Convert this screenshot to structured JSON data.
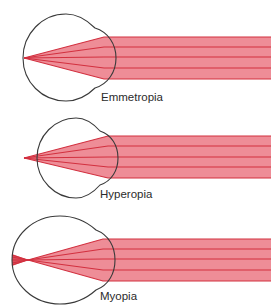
{
  "colors": {
    "beam_fill": "#ee8d97",
    "ray_line": "#d2303f",
    "eye_outline": "#3a3a3a",
    "label_text": "#2b2b2b",
    "background": "#ffffff"
  },
  "panels": [
    {
      "id": "emmetropia",
      "label": "Emmetropia",
      "description": "Parallel rays focus exactly on the retina",
      "focal_point": "on-retina"
    },
    {
      "id": "hyperopia",
      "label": "Hyperopia",
      "description": "Parallel rays focus behind the retina",
      "focal_point": "behind-retina"
    },
    {
      "id": "myopia",
      "label": "Myopia",
      "description": "Parallel rays focus in front of the retina",
      "focal_point": "in-front-of-retina"
    }
  ]
}
